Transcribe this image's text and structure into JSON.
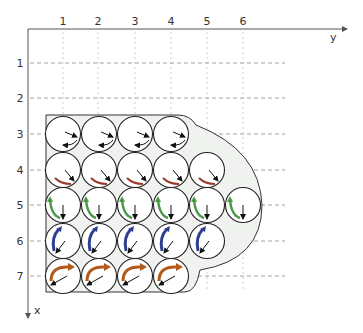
{
  "axes": {
    "y_axis_label": "y",
    "x_axis_label": "x",
    "column_labels": [
      "1",
      "2",
      "3",
      "4",
      "5",
      "6"
    ],
    "row_labels": [
      "1",
      "2",
      "3",
      "4",
      "5",
      "6",
      "7"
    ]
  },
  "colors": {
    "axis": "#555555",
    "grid_dashed": "#888888",
    "grid_dotted": "#cccccc",
    "shape_fill": "#f0f2ef",
    "shape_stroke": "#333333",
    "circle_stroke": "#222222",
    "arrow_black": "#111111",
    "arrow_row4_red": "#9b3a2a",
    "arrow_row5_green": "#4a9a4a",
    "arrow_row6_blue": "#2f3f8f",
    "arrow_row7_orange": "#b25a1a"
  },
  "grid": {
    "rows": [
      {
        "row": 3,
        "columns": [
          1,
          2,
          3,
          4
        ],
        "curved_arrow_color": "black",
        "arrow_direction": "down-right"
      },
      {
        "row": 4,
        "columns": [
          1,
          2,
          3,
          4,
          5
        ],
        "curved_arrow_color": "red",
        "arrow_direction": "down-right"
      },
      {
        "row": 5,
        "columns": [
          1,
          2,
          3,
          4,
          5,
          6
        ],
        "curved_arrow_color": "green",
        "arrow_direction": "down"
      },
      {
        "row": 6,
        "columns": [
          1,
          2,
          3,
          4,
          5
        ],
        "curved_arrow_color": "blue",
        "arrow_direction": "down-left"
      },
      {
        "row": 7,
        "columns": [
          1,
          2,
          3,
          4
        ],
        "curved_arrow_color": "orange",
        "arrow_direction": "left-down"
      }
    ]
  }
}
